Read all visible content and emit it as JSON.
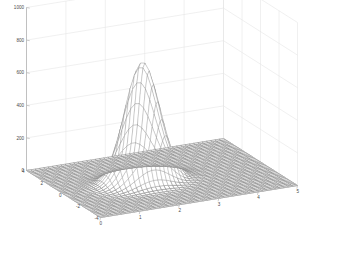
{
  "figure": {
    "title": "",
    "background_color": "#ffffff",
    "width": 338,
    "height": 255
  },
  "chart_data": {
    "type": "surface",
    "render": "mesh",
    "title": "",
    "xlabel": "",
    "ylabel": "",
    "zlabel": "",
    "xlim": [
      0,
      5
    ],
    "ylim": [
      -4,
      4
    ],
    "zlim": [
      0,
      1000
    ],
    "xticks": [
      0,
      1,
      2,
      3,
      4,
      5
    ],
    "yticks": [
      4,
      2,
      0,
      -2,
      -4
    ],
    "zticks": [
      0,
      200,
      400,
      600,
      800,
      1000
    ],
    "xticklabels": [
      "0",
      "1",
      "2",
      "3",
      "4",
      "5"
    ],
    "yticklabels": [
      "4",
      "2",
      "0",
      "-2",
      "-4"
    ],
    "zticklabels": [
      "0",
      "200",
      "400",
      "600",
      "800",
      "1000"
    ],
    "grid": true,
    "legend": false,
    "peak": {
      "x": 2.0,
      "y": 0.0,
      "z": 730,
      "sigma_x": 0.42,
      "sigma_y": 0.62
    },
    "baseline_z": 0,
    "mesh_color": "#ffffff",
    "mesh_edge_color": "#6f6f6f",
    "base_color": "#8a8a8a",
    "grid_color": "#e3e3e3",
    "axis_color": "#b4b4b4",
    "tick_label_color": "#4a4a4a",
    "view": {
      "azimuth": -37.5,
      "elevation": 30
    },
    "surface_function": "z = 730 * exp(-((x-2)^2/(2*0.42^2) + (y-0)^2/(2*0.62^2)))",
    "grid_resolution": {
      "nx": 46,
      "ny": 40
    }
  },
  "axes": {
    "z_axis_name": "vertical-value-axis",
    "y_axis_name": "left-depth-axis",
    "x_axis_name": "bottom-horizontal-axis"
  }
}
